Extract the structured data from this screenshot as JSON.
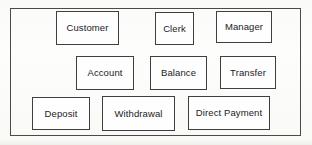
{
  "diagram": {
    "frame": {
      "x": 10,
      "y": 8,
      "width": 291,
      "height": 128
    },
    "colors": {
      "background": "#fdfdfc",
      "frame_stroke": "#4a4a4a",
      "box_stroke": "#3f3f3f",
      "box_fill": "#fefefe",
      "text": "#1b1b1b"
    },
    "rows": [
      {
        "name": "actors-row",
        "nodes": [
          {
            "label": "Customer",
            "x": 56,
            "y": 11,
            "width": 63,
            "height": 34
          },
          {
            "label": "Clerk",
            "x": 155,
            "y": 12,
            "width": 39,
            "height": 33
          },
          {
            "label": "Manager",
            "x": 216,
            "y": 11,
            "width": 56,
            "height": 32
          }
        ]
      },
      {
        "name": "accounts-row",
        "nodes": [
          {
            "label": "Account",
            "x": 76,
            "y": 56,
            "width": 58,
            "height": 34
          },
          {
            "label": "Balance",
            "x": 150,
            "y": 56,
            "width": 57,
            "height": 34
          },
          {
            "label": "Transfer",
            "x": 220,
            "y": 56,
            "width": 56,
            "height": 33
          }
        ]
      },
      {
        "name": "transactions-row",
        "nodes": [
          {
            "label": "Deposit",
            "x": 32,
            "y": 97,
            "width": 58,
            "height": 33
          },
          {
            "label": "Withdrawal",
            "x": 102,
            "y": 96,
            "width": 73,
            "height": 35
          },
          {
            "label": "Direct Payment",
            "x": 188,
            "y": 96,
            "width": 82,
            "height": 34
          }
        ]
      }
    ]
  }
}
